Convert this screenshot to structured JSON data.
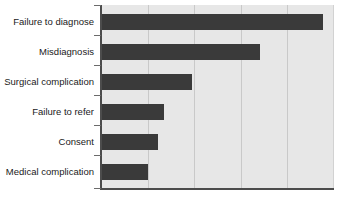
{
  "chart_data": {
    "type": "bar",
    "orientation": "horizontal",
    "title": "",
    "subtitle": "",
    "xlabel": "",
    "ylabel": "",
    "categories": [
      "Failure to diagnose",
      "Misdiagnosis",
      "Surgical complication",
      "Failure to refer",
      "Consent",
      "Medical complication"
    ],
    "values": [
      4.75,
      3.4,
      1.94,
      1.33,
      1.21,
      0.98
    ],
    "xlim": [
      0,
      5
    ],
    "ylim": null,
    "grid": "vertical",
    "gridline_values": [
      1,
      2,
      3,
      4
    ],
    "tick_labels": [],
    "legend": null,
    "legend_position": "none",
    "annotations": [],
    "series": [
      {
        "name": "Claims",
        "values": [
          4.75,
          3.4,
          1.94,
          1.33,
          1.21,
          0.98
        ]
      }
    ]
  },
  "style": {
    "bar_color": "#3a3a3a",
    "plot_background": "#e7e7e7",
    "page_background": "#ffffff",
    "gridline_color": "#c9c9c9",
    "axis_color": "#4c4c4c",
    "label_color": "#1a1a1a"
  },
  "geometry": {
    "plot_left": 101,
    "plot_top": 5,
    "plot_width": 233,
    "plot_height": 184,
    "gridline_x": [
      148,
      196,
      244,
      292
    ],
    "bar_end_x": [
      329,
      264,
      194,
      165,
      159,
      148
    ],
    "bar_top_y": [
      14,
      44,
      74,
      104,
      134,
      164
    ],
    "bar_height": 16,
    "tick_y": [
      5,
      35,
      65,
      95,
      125,
      155,
      188
    ],
    "label_top_y": [
      16,
      46,
      76,
      106,
      136,
      166
    ]
  }
}
